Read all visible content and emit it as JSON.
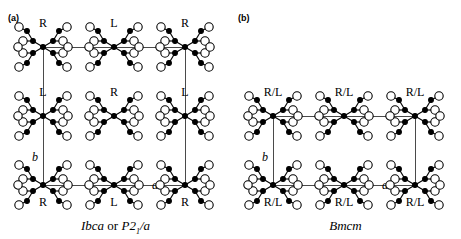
{
  "figure": {
    "type": "crystal-structure-packing-diagram",
    "panels": [
      {
        "id": "a",
        "label": "(a)",
        "caption": {
          "full": "Ibca or P2₁/a",
          "part1": "Ibca",
          "conjunction": "or",
          "part2_base": "P2",
          "part2_sub": "1",
          "part2_tail": "/a"
        },
        "grid": {
          "rows": 3,
          "cols": 3
        },
        "axis_labels": {
          "a": "a",
          "b": "b"
        },
        "molecule_labels": [
          [
            "R",
            "L",
            "R"
          ],
          [
            "L",
            "R",
            "L"
          ],
          [
            "R",
            "L",
            "R"
          ]
        ],
        "label_positions": [
          "above",
          "above",
          "above",
          "above",
          "above",
          "above",
          "below",
          "below",
          "below"
        ]
      },
      {
        "id": "b",
        "label": "(b)",
        "caption": {
          "full": "Bmcm",
          "part1": "Bmcm",
          "conjunction": "",
          "part2_base": "",
          "part2_sub": "",
          "part2_tail": ""
        },
        "grid": {
          "rows": 2,
          "cols": 3
        },
        "axis_labels": {
          "a": "a",
          "b": "b"
        },
        "molecule_labels": [
          [
            "R/L",
            "R/L",
            "R/L"
          ],
          [
            "R/L",
            "R/L",
            "R/L"
          ]
        ],
        "label_positions": [
          "above",
          "above",
          "above",
          "below",
          "below",
          "below"
        ]
      }
    ],
    "colors": {
      "background": "#ffffff",
      "atom_outline": "#000000",
      "atom_fill_open": "#ffffff",
      "atom_fill_solid": "#000000",
      "bond": "#000000",
      "lattice_line": "#4a4a4a",
      "text": "#000000"
    }
  }
}
